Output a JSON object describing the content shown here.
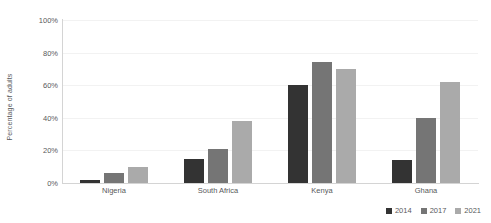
{
  "chart_data": {
    "type": "bar",
    "title": "",
    "subtitle": "",
    "xlabel": "",
    "ylabel": "Percentage of adults",
    "ylim": [
      0,
      100
    ],
    "ytick_labels": [
      "0%",
      "20%",
      "40%",
      "60%",
      "80%",
      "100%"
    ],
    "ytick_values": [
      0,
      20,
      40,
      60,
      80,
      100
    ],
    "grid": true,
    "grid_axis": "y",
    "legend_position": "bottom-right",
    "categories": [
      "Nigeria",
      "South Africa",
      "Kenya",
      "Ghana"
    ],
    "series": [
      {
        "name": "2014",
        "color": "#333333",
        "values": [
          2,
          15,
          60,
          14
        ]
      },
      {
        "name": "2017",
        "color": "#757575",
        "values": [
          6,
          21,
          74,
          40
        ]
      },
      {
        "name": "2021",
        "color": "#aaaaaa",
        "values": [
          10,
          38,
          70,
          62
        ]
      }
    ]
  },
  "axis": {
    "line_color": "#d4d4d4",
    "grid_color": "#f2f2f2",
    "text_color": "#58595b"
  }
}
